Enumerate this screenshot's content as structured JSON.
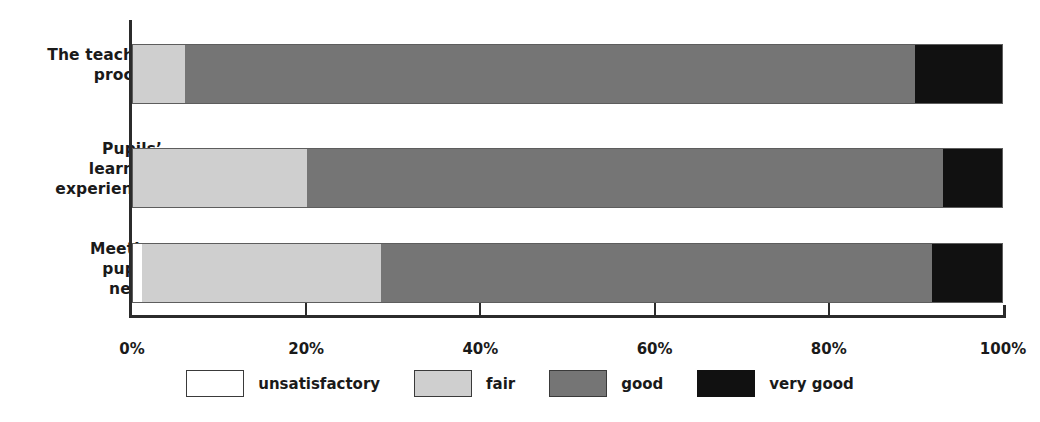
{
  "chart_data": {
    "type": "bar",
    "orientation": "horizontal",
    "stacked": "100%",
    "title": "",
    "xlabel": "",
    "ylabel": "",
    "xlim": [
      0,
      100
    ],
    "grid": false,
    "legend_position": "bottom",
    "categories": [
      "The teaching\nprocess",
      "Pupils’\nlearning\nexperiences",
      "Meeting\npupils’\nneeds"
    ],
    "tick_labels": [
      "0%",
      "20%",
      "40%",
      "60%",
      "80%",
      "100%"
    ],
    "tick_values": [
      0,
      20,
      40,
      60,
      80,
      100
    ],
    "series": [
      {
        "name": "unsatisfactory",
        "color": "#ffffff",
        "values": [
          0,
          0,
          1
        ]
      },
      {
        "name": "fair",
        "color": "#cfcfcf",
        "values": [
          6,
          20,
          27.5
        ]
      },
      {
        "name": "good",
        "color": "#757575",
        "values": [
          84,
          73.2,
          63.5
        ]
      },
      {
        "name": "very good",
        "color": "#111111",
        "values": [
          10,
          6.8,
          8
        ]
      }
    ]
  },
  "axis": {
    "category_labels": [
      {
        "line1": "The teaching",
        "line2": "process",
        "line3": ""
      },
      {
        "line1": "Pupils’",
        "line2": "learning",
        "line3": "experiences"
      },
      {
        "line1": "Meeting",
        "line2": "pupils’",
        "line3": "needs"
      }
    ],
    "ticks": [
      {
        "label": "0%",
        "value": 0
      },
      {
        "label": "20%",
        "value": 20
      },
      {
        "label": "40%",
        "value": 40
      },
      {
        "label": "60%",
        "value": 60
      },
      {
        "label": "80%",
        "value": 80
      },
      {
        "label": "100%",
        "value": 100
      }
    ]
  },
  "legend": {
    "items": [
      {
        "label": "unsatisfactory",
        "key": "unsat",
        "color": "#ffffff"
      },
      {
        "label": "fair",
        "key": "fair",
        "color": "#cfcfcf"
      },
      {
        "label": "good",
        "key": "good",
        "color": "#757575"
      },
      {
        "label": "very good",
        "key": "verygood",
        "color": "#111111"
      }
    ]
  },
  "colors": {
    "axis": "#2b2b2b",
    "text": "#1a1a1a",
    "background": "#ffffff",
    "bar_border": "#5d5d5d"
  }
}
